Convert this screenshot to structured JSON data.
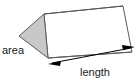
{
  "figure": {
    "shape_name": "triangular-prism",
    "labels": {
      "area": "area",
      "length": "length"
    },
    "colors": {
      "background": "#ffffff",
      "outline": "#5a5a5a",
      "end_face_fill": "#c8c8c8",
      "side_face_fill": "#ffffff",
      "arrow": "#000000",
      "text": "#1a1a1a"
    },
    "geometry": {
      "triangle_apex": [
        44,
        14
      ],
      "triangle_left": [
        19,
        36
      ],
      "triangle_bottom": [
        48,
        58
      ],
      "ridge_far": [
        123,
        6
      ],
      "bottom_far": [
        132,
        52
      ],
      "arrow_start": [
        50,
        62
      ],
      "arrow_end": [
        133,
        47
      ]
    },
    "annotations": {
      "area_target": "triangular-end-face",
      "length_target": "bottom-edge-double-arrow"
    }
  }
}
